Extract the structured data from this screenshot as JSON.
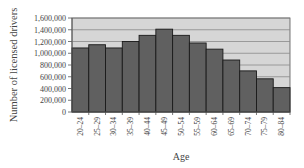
{
  "chart_data": {
    "type": "bar",
    "title": "",
    "xlabel": "Age",
    "ylabel": "Number of licensed drivers",
    "categories": [
      "20–24",
      "25–29",
      "30–34",
      "35–39",
      "40–44",
      "45–49",
      "50–54",
      "55–59",
      "60–64",
      "65–69",
      "70–74",
      "75–79",
      "80–84"
    ],
    "values": [
      1090000,
      1145000,
      1090000,
      1200000,
      1305000,
      1410000,
      1305000,
      1175000,
      1070000,
      885000,
      700000,
      565000,
      415000
    ],
    "ylim": [
      0,
      1600000
    ],
    "yticks": [
      0,
      200000,
      400000,
      600000,
      800000,
      1000000,
      1200000,
      1400000,
      1600000
    ],
    "ytick_labels": [
      "0",
      "200,000",
      "400,000",
      "600,000",
      "800,000",
      "1,000,000",
      "1,200,000",
      "1,400,000",
      "1,600,000"
    ],
    "grid": true,
    "legend": null
  },
  "colors": {
    "plot_background": "#d6d6d6",
    "bar_fill": "#606060",
    "bar_edge": "#1a1a1a",
    "gridline": "#8a8a8a",
    "axis": "#555555"
  }
}
